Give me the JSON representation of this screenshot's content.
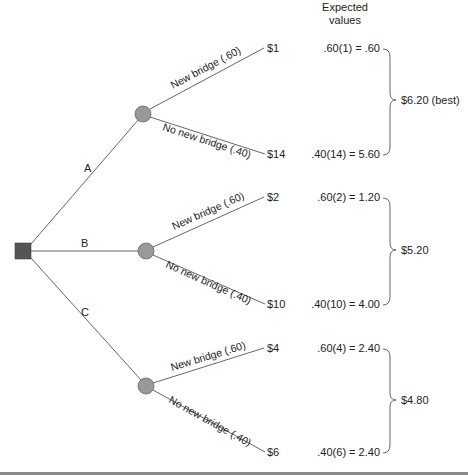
{
  "header": {
    "line1": "Expected",
    "line2": "values"
  },
  "decision_node": {
    "shape": "square",
    "color": "#555555"
  },
  "chance_node_color": "#999999",
  "alternatives": [
    {
      "label": "A",
      "outcomes": [
        {
          "branch": "New bridge (.60)",
          "payoff": "$1",
          "ev_calc": ".60(1) = .60"
        },
        {
          "branch": "No new bridge (.40)",
          "payoff": "$14",
          "ev_calc": ".40(14) = 5.60"
        }
      ],
      "expected_value": "$6.20 (best)"
    },
    {
      "label": "B",
      "outcomes": [
        {
          "branch": "New bridge (.60)",
          "payoff": "$2",
          "ev_calc": ".60(2) = 1.20"
        },
        {
          "branch": "No new bridge (.40)",
          "payoff": "$10",
          "ev_calc": ".40(10) = 4.00"
        }
      ],
      "expected_value": "$5.20"
    },
    {
      "label": "C",
      "outcomes": [
        {
          "branch": "New bridge (.60)",
          "payoff": "$4",
          "ev_calc": ".60(4) = 2.40"
        },
        {
          "branch": "No new bridge (.40)",
          "payoff": "$6",
          "ev_calc": ".40(6) = 2.40"
        }
      ],
      "expected_value": "$4.80"
    }
  ]
}
